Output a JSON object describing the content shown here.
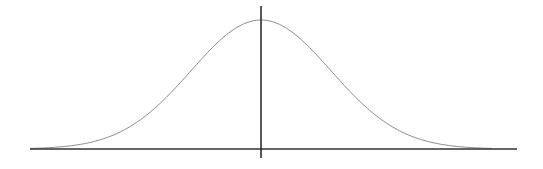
{
  "chart_data": {
    "type": "line",
    "title": "",
    "xlabel": "",
    "ylabel": "",
    "series": [
      {
        "name": "normal-pdf",
        "mean": 0,
        "std": 1,
        "x": [
          -3.3,
          -3,
          -2.5,
          -2,
          -1.5,
          -1,
          -0.5,
          0,
          0.5,
          1,
          1.5,
          2,
          2.5,
          3,
          3.3
        ],
        "values": [
          0.0017,
          0.0044,
          0.0175,
          0.054,
          0.1295,
          0.242,
          0.3521,
          0.3989,
          0.3521,
          0.242,
          0.1295,
          0.054,
          0.0175,
          0.0044,
          0.0017
        ]
      }
    ],
    "xlim": [
      -3.3,
      3.3
    ],
    "ylim": [
      0,
      0.42
    ],
    "grid": false,
    "legend": "none",
    "colors": {
      "curve": "#8a8a8a",
      "axis": "#333333",
      "background": "#ffffff"
    }
  },
  "layout": {
    "axis_y_px": 149,
    "axis_x_start_px": 30,
    "axis_x_end_px": 517,
    "center_x_px": 261,
    "vline_top_px": 6,
    "vline_bottom_px": 158,
    "peak_y_px": 20,
    "sigma_px": 70
  }
}
